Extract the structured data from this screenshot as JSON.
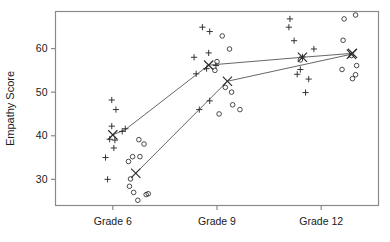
{
  "chart_data": {
    "type": "scatter",
    "title": "",
    "xlabel": "",
    "ylabel": "Empathy Score",
    "x_categories": [
      "Grade 6",
      "Grade 9",
      "Grade 12"
    ],
    "x_positions": [
      1,
      2,
      3
    ],
    "xlim": [
      0.45,
      3.55
    ],
    "ylim": [
      24,
      68.5
    ],
    "y_ticks": [
      30,
      40,
      50,
      60
    ],
    "x_ticks": [
      1,
      2,
      3
    ],
    "grid": false,
    "legend": null,
    "frame": "box",
    "series": [
      {
        "name": "plus-group",
        "marker": "plus",
        "means": [
          41.3,
          56.2,
          58.0,
          58.8
        ],
        "mean_points": [
          {
            "x": 1.0,
            "y": 40.2
          },
          {
            "x": 1.12,
            "y": 41.4
          },
          {
            "x": 1.92,
            "y": 56.2
          },
          {
            "x": 2.82,
            "y": 58.0
          },
          {
            "x": 3.3,
            "y": 58.9
          }
        ],
        "points": [
          {
            "x": 0.93,
            "y": 35.0
          },
          {
            "x": 0.95,
            "y": 30.0
          },
          {
            "x": 0.99,
            "y": 48.2
          },
          {
            "x": 1.03,
            "y": 46.0
          },
          {
            "x": 0.99,
            "y": 42.2
          },
          {
            "x": 0.97,
            "y": 39.2
          },
          {
            "x": 1.02,
            "y": 39.0
          },
          {
            "x": 1.01,
            "y": 37.2
          },
          {
            "x": 1.09,
            "y": 41.0
          },
          {
            "x": 1.12,
            "y": 41.6
          },
          {
            "x": 1.78,
            "y": 58.0
          },
          {
            "x": 1.8,
            "y": 54.2
          },
          {
            "x": 1.86,
            "y": 64.9
          },
          {
            "x": 1.93,
            "y": 63.9
          },
          {
            "x": 1.92,
            "y": 59.0
          },
          {
            "x": 1.9,
            "y": 55.4
          },
          {
            "x": 1.99,
            "y": 56.1
          },
          {
            "x": 1.83,
            "y": 46.0
          },
          {
            "x": 1.93,
            "y": 48.0
          },
          {
            "x": 2.7,
            "y": 66.8
          },
          {
            "x": 2.69,
            "y": 64.9
          },
          {
            "x": 2.74,
            "y": 61.8
          },
          {
            "x": 2.82,
            "y": 58.1
          },
          {
            "x": 2.8,
            "y": 55.2
          },
          {
            "x": 2.77,
            "y": 54.1
          },
          {
            "x": 2.88,
            "y": 53.0
          },
          {
            "x": 2.93,
            "y": 59.9
          },
          {
            "x": 2.85,
            "y": 49.9
          }
        ]
      },
      {
        "name": "circle-group",
        "marker": "circle",
        "mean_points": [
          {
            "x": 1.22,
            "y": 31.4
          },
          {
            "x": 2.1,
            "y": 52.5
          },
          {
            "x": 3.29,
            "y": 58.7
          }
        ],
        "points": [
          {
            "x": 1.15,
            "y": 34.1
          },
          {
            "x": 1.19,
            "y": 35.2
          },
          {
            "x": 1.25,
            "y": 39.1
          },
          {
            "x": 1.3,
            "y": 38.1
          },
          {
            "x": 1.26,
            "y": 35.2
          },
          {
            "x": 1.17,
            "y": 30.1
          },
          {
            "x": 1.16,
            "y": 28.4
          },
          {
            "x": 1.2,
            "y": 27.0
          },
          {
            "x": 1.24,
            "y": 25.2
          },
          {
            "x": 1.32,
            "y": 26.5
          },
          {
            "x": 1.34,
            "y": 26.7
          },
          {
            "x": 2.05,
            "y": 62.9
          },
          {
            "x": 2.12,
            "y": 59.9
          },
          {
            "x": 2.0,
            "y": 57.0
          },
          {
            "x": 1.98,
            "y": 55.0
          },
          {
            "x": 2.08,
            "y": 51.1
          },
          {
            "x": 2.14,
            "y": 50.0
          },
          {
            "x": 2.02,
            "y": 45.0
          },
          {
            "x": 2.15,
            "y": 47.1
          },
          {
            "x": 2.22,
            "y": 46.0
          },
          {
            "x": 2.8,
            "y": 57.4
          },
          {
            "x": 3.22,
            "y": 66.8
          },
          {
            "x": 3.33,
            "y": 67.7
          },
          {
            "x": 3.21,
            "y": 61.9
          },
          {
            "x": 3.29,
            "y": 58.4
          },
          {
            "x": 3.2,
            "y": 55.2
          },
          {
            "x": 3.34,
            "y": 56.1
          },
          {
            "x": 3.33,
            "y": 54.0
          },
          {
            "x": 3.3,
            "y": 53.1
          }
        ]
      }
    ],
    "connector_lines": [
      {
        "name": "plus-trend",
        "points": [
          {
            "x": 1.0,
            "y": 40.2
          },
          {
            "x": 1.12,
            "y": 41.4
          },
          {
            "x": 1.92,
            "y": 56.2
          },
          {
            "x": 2.82,
            "y": 58.0
          },
          {
            "x": 3.3,
            "y": 58.9
          }
        ]
      },
      {
        "name": "circle-trend",
        "points": [
          {
            "x": 1.22,
            "y": 31.4
          },
          {
            "x": 2.1,
            "y": 52.5
          },
          {
            "x": 3.29,
            "y": 58.7
          }
        ]
      }
    ],
    "colors": {
      "marker": "#2b2b2b",
      "line": "#555555",
      "frame": "#8a8a8a",
      "text": "#1a1a1a"
    }
  }
}
